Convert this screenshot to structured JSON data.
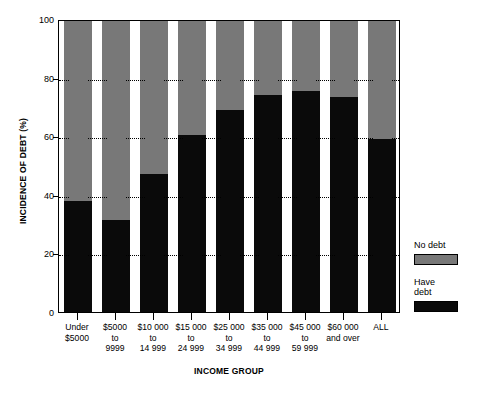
{
  "chart_data": {
    "type": "bar",
    "stacked": true,
    "title": "",
    "xlabel": "INCOME GROUP",
    "ylabel": "INCIDENCE OF DEBT (%)",
    "ylim": [
      0,
      100
    ],
    "yticks": [
      0,
      20,
      40,
      60,
      80,
      100
    ],
    "ytick_labels": [
      "0",
      "20",
      "40",
      "60",
      "80",
      "100"
    ],
    "grid": true,
    "legend_position": "right",
    "categories": [
      "Under\n$5000",
      "$5000\nto\n9999",
      "$10 000\nto\n14 999",
      "$15 000\nto\n24 999",
      "$25 000\nto\n34 999",
      "$35 000\nto\n44 999",
      "$45 000\nto\n59 999",
      "$60 000\nand over",
      "ALL"
    ],
    "series": [
      {
        "name": "Have debt",
        "color": "#0a0a0a",
        "values": [
          38,
          31.5,
          47,
          60.5,
          69,
          74,
          75.5,
          73.5,
          59
        ]
      },
      {
        "name": "No debt",
        "color": "#787878",
        "values": [
          62,
          68.5,
          53,
          39.5,
          31,
          26,
          24.5,
          26.5,
          41
        ]
      }
    ]
  },
  "legend": {
    "entries": [
      {
        "label": "No debt",
        "color": "#787878"
      },
      {
        "label": "Have\ndebt",
        "color": "#0a0a0a"
      }
    ]
  }
}
